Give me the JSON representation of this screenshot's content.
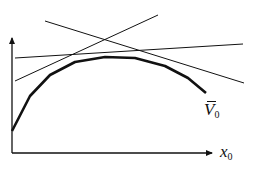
{
  "diagram": {
    "colors": {
      "stroke": "#111111",
      "background": "#ffffff"
    },
    "axes": {
      "y_axis": {
        "x": 12,
        "y_top": 36,
        "y_bottom": 153,
        "arrow": true
      },
      "x_axis": {
        "y": 153,
        "x_left": 12,
        "x_right": 212,
        "arrow": true
      },
      "x_label": {
        "main": "x",
        "sub": "0"
      }
    },
    "curve": {
      "label": {
        "main": "V",
        "sub": "0",
        "overbar": true
      },
      "points": [
        [
          12,
          131
        ],
        [
          30,
          96
        ],
        [
          50,
          75
        ],
        [
          75,
          62
        ],
        [
          105,
          57
        ],
        [
          135,
          58
        ],
        [
          165,
          66
        ],
        [
          188,
          78
        ],
        [
          206,
          93
        ]
      ]
    },
    "lines": [
      {
        "name": "nearly-flat-line",
        "from": [
          15,
          58
        ],
        "to": [
          243,
          44
        ]
      },
      {
        "name": "rising-line",
        "from": [
          15,
          81
        ],
        "to": [
          158,
          15
        ]
      },
      {
        "name": "falling-line",
        "from": [
          45,
          21
        ],
        "to": [
          244,
          83
        ]
      }
    ]
  }
}
